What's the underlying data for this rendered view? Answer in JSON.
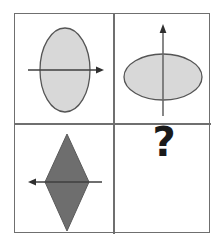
{
  "puzzle": {
    "type": "matrix-reasoning",
    "rows": 2,
    "columns": 2,
    "frame_color": "#6f6f6f",
    "background_color": "#ffffff",
    "cells": [
      {
        "position": "top-left",
        "shape": "ellipse",
        "orientation": "vertical",
        "fill_color": "#d8d8d8",
        "outline_color": "#555555",
        "axis": "horizontal",
        "axis_arrow_direction": "right",
        "axis_color": "#4a4a4a"
      },
      {
        "position": "top-right",
        "shape": "ellipse",
        "orientation": "horizontal",
        "fill_color": "#d8d8d8",
        "outline_color": "#555555",
        "axis": "vertical",
        "axis_arrow_direction": "up",
        "axis_color": "#6a6a6a"
      },
      {
        "position": "bottom-left",
        "shape": "rhombus",
        "orientation": "vertical",
        "fill_color": "#6e6e6e",
        "outline_color": "#5a5a5a",
        "axis": "horizontal",
        "axis_arrow_direction": "left",
        "axis_color": "#4a4a4a"
      },
      {
        "position": "bottom-right",
        "shape": "unknown",
        "label": "?",
        "label_color": "#1a1a1a"
      }
    ]
  }
}
